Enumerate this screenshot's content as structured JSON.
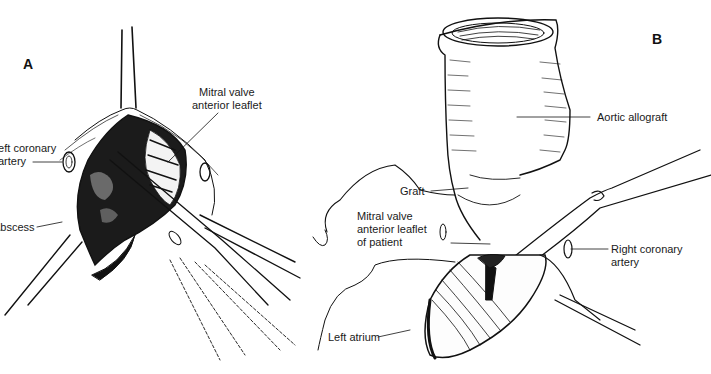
{
  "figure": {
    "panels": [
      {
        "id": "A",
        "letter": "A",
        "labels": {
          "mitral_valve": "Mitral valve\nanterior leaflet",
          "mitral_line1": "Mitral valve",
          "mitral_line2": "anterior leaflet",
          "left_coronary_line1": "Left coronary",
          "left_coronary_line2": "artery",
          "abscess": "Abscess"
        }
      },
      {
        "id": "B",
        "letter": "B",
        "labels": {
          "aortic_allograft": "Aortic allograft",
          "graft": "Graft",
          "mitral_line1": "Mitral valve",
          "mitral_line2": "anterior leaflet",
          "mitral_line3": "of patient",
          "right_coronary_line1": "Right coronary",
          "right_coronary_line2": "artery",
          "left_atrium": "Left atrium"
        }
      }
    ],
    "colors": {
      "ink": "#111111",
      "background": "#ffffff"
    }
  }
}
